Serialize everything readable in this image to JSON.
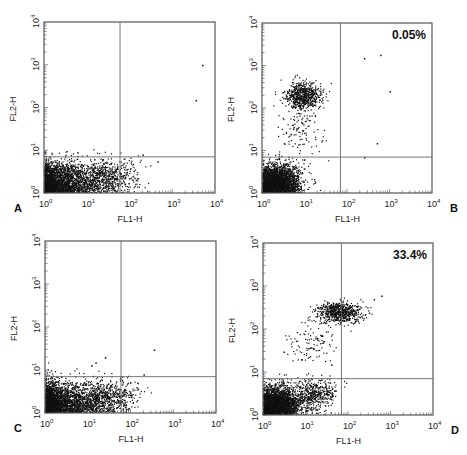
{
  "figure": {
    "layout": "2x2 grid of flow cytometry dot plots",
    "colors": {
      "dots": "#111111",
      "frame": "#555555",
      "gate": "#666666",
      "background": "#ffffff"
    }
  },
  "chart_data": [
    {
      "type": "scatter",
      "panel": "A",
      "title": "",
      "xlabel": "FL1-H",
      "ylabel": "FL2-H",
      "x_scale": "log",
      "y_scale": "log",
      "xlim": [
        1,
        10000
      ],
      "ylim": [
        1,
        10000
      ],
      "x_ticks": [
        "10^0",
        "10^1",
        "10^2",
        "10^3",
        "10^4"
      ],
      "y_ticks": [
        "10^0",
        "10^1",
        "10^2",
        "10^3",
        "10^4"
      ],
      "quadrant_gate": {
        "x": 60,
        "y": 7
      },
      "annotation": "",
      "populations": [
        {
          "name": "double-negative (lower-left)",
          "center": [
            2,
            1.8
          ],
          "spread_decades": [
            0.9,
            0.4
          ],
          "density": "very high"
        },
        {
          "name": "FL1 tail",
          "center": [
            30,
            2.5
          ],
          "spread_decades": [
            0.6,
            0.35
          ],
          "density": "medium"
        }
      ],
      "outliers": [
        [
          5000,
          1000
        ],
        [
          3500,
          150
        ],
        [
          200,
          8
        ],
        [
          450,
          5.5
        ],
        [
          6,
          9
        ]
      ]
    },
    {
      "type": "scatter",
      "panel": "B",
      "title": "",
      "xlabel": "FL1-H",
      "ylabel": "FL2-H",
      "x_scale": "log",
      "y_scale": "log",
      "xlim": [
        1,
        10000
      ],
      "ylim": [
        1,
        10000
      ],
      "x_ticks": [
        "10^0",
        "10^1",
        "10^2",
        "10^3",
        "10^4"
      ],
      "y_ticks": [
        "10^0",
        "10^1",
        "10^2",
        "10^3",
        "10^4"
      ],
      "quadrant_gate": {
        "x": 70,
        "y": 7
      },
      "annotation": "0.05%",
      "annotation_quadrant": "upper-right",
      "populations": [
        {
          "name": "double-negative",
          "center": [
            2.2,
            1.8
          ],
          "spread_decades": [
            0.45,
            0.35
          ],
          "density": "very high"
        },
        {
          "name": "FL2-high / FL1-low",
          "center": [
            9,
            200
          ],
          "spread_decades": [
            0.35,
            0.25
          ],
          "density": "high"
        },
        {
          "name": "scatter between",
          "center": [
            8,
            30
          ],
          "spread_decades": [
            0.4,
            0.5
          ],
          "density": "low"
        }
      ],
      "outliers": [
        [
          250,
          1500
        ],
        [
          600,
          1800
        ],
        [
          1000,
          250
        ],
        [
          500,
          15
        ],
        [
          250,
          7
        ]
      ]
    },
    {
      "type": "scatter",
      "panel": "C",
      "title": "",
      "xlabel": "FL1-H",
      "ylabel": "FL2-H",
      "x_scale": "log",
      "y_scale": "log",
      "xlim": [
        1,
        10000
      ],
      "ylim": [
        1,
        10000
      ],
      "x_ticks": [
        "10^0",
        "10^1",
        "10^2",
        "10^3",
        "10^4"
      ],
      "y_ticks": [
        "10^0",
        "10^1",
        "10^2",
        "10^3",
        "10^4"
      ],
      "quadrant_gate": {
        "x": 60,
        "y": 7
      },
      "annotation": "",
      "populations": [
        {
          "name": "double-negative",
          "center": [
            2,
            1.8
          ],
          "spread_decades": [
            0.9,
            0.4
          ],
          "density": "very high"
        },
        {
          "name": "FL1 tail",
          "center": [
            30,
            2.5
          ],
          "spread_decades": [
            0.55,
            0.35
          ],
          "density": "medium"
        }
      ],
      "outliers": [
        [
          350,
          30
        ],
        [
          25,
          20
        ],
        [
          15,
          15
        ],
        [
          12,
          13
        ],
        [
          200,
          8
        ]
      ]
    },
    {
      "type": "scatter",
      "panel": "D",
      "title": "",
      "xlabel": "FL1-H",
      "ylabel": "FL2-H",
      "x_scale": "log",
      "y_scale": "log",
      "xlim": [
        1,
        10000
      ],
      "ylim": [
        1,
        10000
      ],
      "x_ticks": [
        "10^0",
        "10^1",
        "10^2",
        "10^3",
        "10^4"
      ],
      "y_ticks": [
        "10^0",
        "10^1",
        "10^2",
        "10^3",
        "10^4"
      ],
      "quadrant_gate": {
        "x": 70,
        "y": 7
      },
      "annotation": "33.4%",
      "annotation_quadrant": "upper-right",
      "populations": [
        {
          "name": "double-negative",
          "center": [
            2,
            1.8
          ],
          "spread_decades": [
            0.45,
            0.35
          ],
          "density": "very high"
        },
        {
          "name": "FL1-low tail",
          "center": [
            15,
            3
          ],
          "spread_decades": [
            0.4,
            0.3
          ],
          "density": "medium"
        },
        {
          "name": "double-positive cluster",
          "center": [
            60,
            250
          ],
          "spread_decades": [
            0.45,
            0.2
          ],
          "density": "high"
        },
        {
          "name": "scatter between",
          "center": [
            15,
            50
          ],
          "spread_decades": [
            0.5,
            0.45
          ],
          "density": "low"
        }
      ],
      "outliers": [
        [
          600,
          600
        ],
        [
          400,
          500
        ],
        [
          3,
          30
        ],
        [
          8,
          20
        ],
        [
          40,
          15
        ]
      ]
    }
  ],
  "panels": [
    {
      "id": "A",
      "letter": "A",
      "xlabel": "FL1-H",
      "ylabel": "FL2-H",
      "annotation": ""
    },
    {
      "id": "B",
      "letter": "B",
      "xlabel": "FL1-H",
      "ylabel": "FL2-H",
      "annotation": "0.05%"
    },
    {
      "id": "C",
      "letter": "C",
      "xlabel": "FL1-H",
      "ylabel": "FL2-H",
      "annotation": ""
    },
    {
      "id": "D",
      "letter": "D",
      "xlabel": "FL1-H",
      "ylabel": "FL2-H",
      "annotation": "33.4%"
    }
  ],
  "ticks": {
    "x": [
      {
        "base": "10",
        "exp": "0"
      },
      {
        "base": "10",
        "exp": "1"
      },
      {
        "base": "10",
        "exp": "2"
      },
      {
        "base": "10",
        "exp": "3"
      },
      {
        "base": "10",
        "exp": "4"
      }
    ],
    "y": [
      {
        "base": "10",
        "exp": "0"
      },
      {
        "base": "10",
        "exp": "1"
      },
      {
        "base": "10",
        "exp": "2"
      },
      {
        "base": "10",
        "exp": "3"
      },
      {
        "base": "10",
        "exp": "4"
      }
    ]
  }
}
